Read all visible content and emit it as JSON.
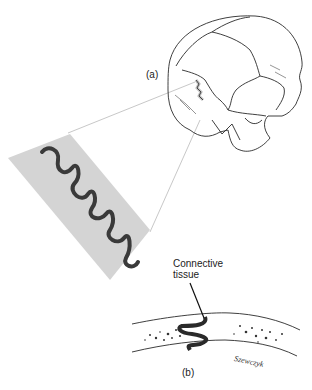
{
  "figure": {
    "labels": {
      "a": "(a)",
      "b": "(b)",
      "connective_line1": "Connective",
      "connective_line2": "tissue",
      "signature": "Szewczyk"
    },
    "colors": {
      "inset_fill": "#d4d4d4",
      "suture_line": "#3a3a3a",
      "guide_lines": "#c8c8c8",
      "ink": "#2a2a2a"
    }
  }
}
